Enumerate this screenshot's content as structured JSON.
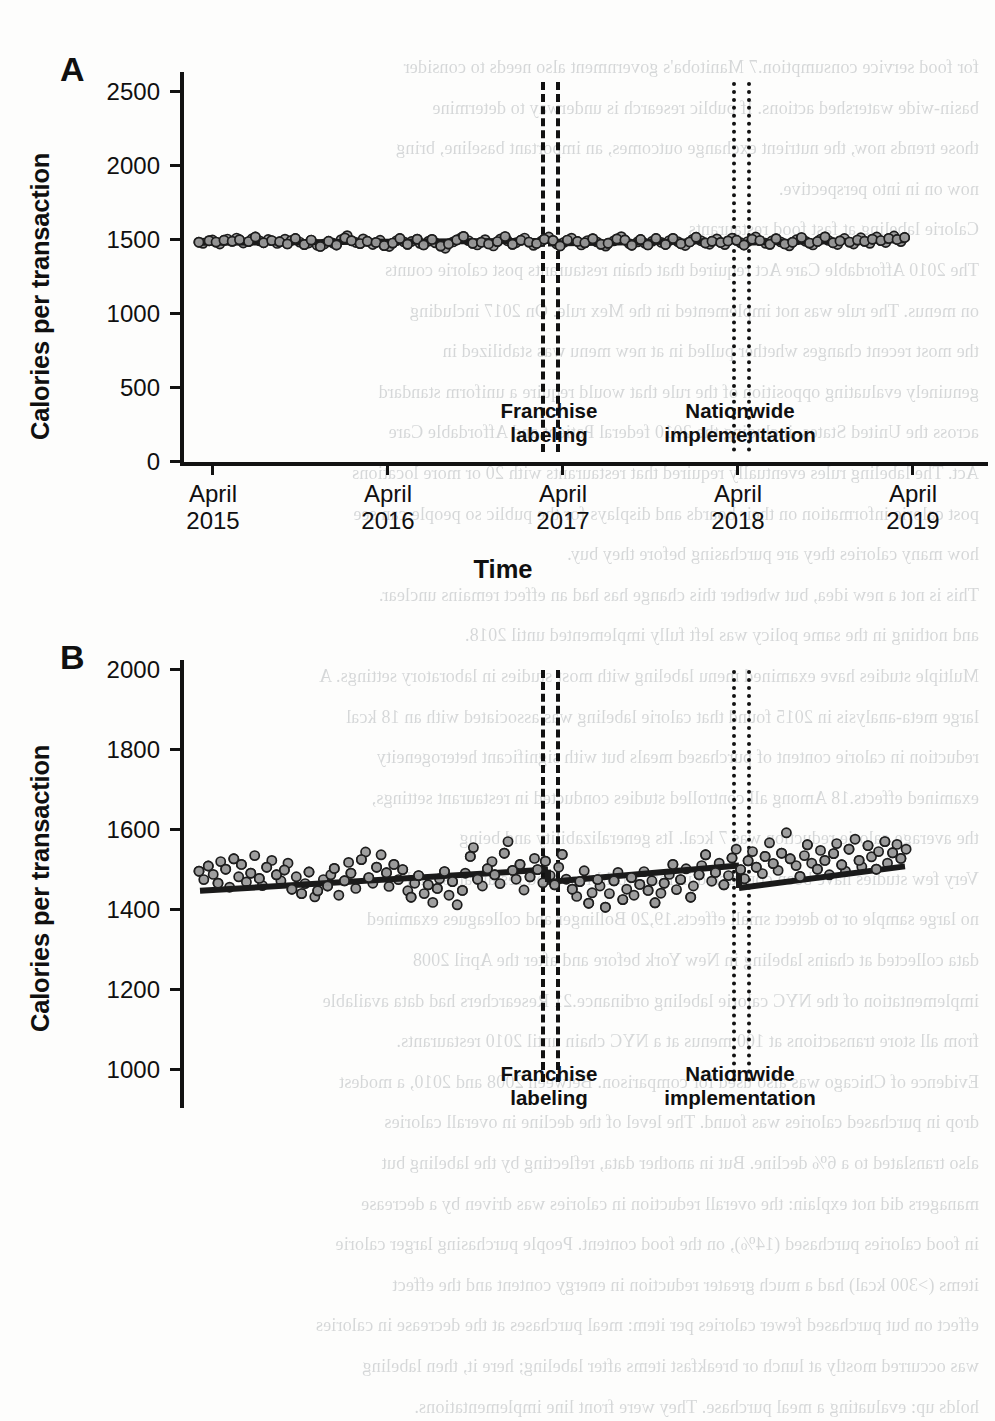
{
  "figure": {
    "background_color": "#fdfdfc",
    "ink_color": "#111111",
    "point_fill": "#9a9a9a",
    "point_stroke": "#1d1d1d",
    "trend_color": "#1a1a1a"
  },
  "panels": [
    {
      "letter": "A",
      "ylabel": "Calories per transaction",
      "xlabel": "",
      "yticks": [
        "0",
        "500",
        "1000",
        "1500",
        "2000",
        "2500"
      ],
      "xticks": [
        {
          "line1": "April",
          "line2": "2015"
        },
        {
          "line1": "April",
          "line2": "2016"
        },
        {
          "line1": "April",
          "line2": "2017"
        },
        {
          "line1": "April",
          "line2": "2018"
        },
        {
          "line1": "April",
          "line2": "2019"
        }
      ],
      "annotations": [
        {
          "line1": "Franchise",
          "line2": "labeling"
        },
        {
          "line1": "Nationwide",
          "line2": "implementation"
        }
      ]
    },
    {
      "letter": "B",
      "ylabel": "Calories per transaction",
      "xlabel": "Time",
      "yticks": [
        "1000",
        "1200",
        "1400",
        "1600",
        "1800",
        "2000"
      ],
      "xticks": [
        {
          "line1": "April",
          "line2": "2015"
        },
        {
          "line1": "April",
          "line2": "2016"
        },
        {
          "line1": "April",
          "line2": "2017"
        },
        {
          "line1": "April",
          "line2": "2018"
        },
        {
          "line1": "April",
          "line2": "2019"
        }
      ],
      "annotations": [
        {
          "line1": "Franchise",
          "line2": "labeling"
        },
        {
          "line1": "Nationwide",
          "line2": "implementation"
        }
      ]
    }
  ],
  "axis_titles": {
    "x": "Time",
    "y": "Calories per transaction"
  },
  "bleed_text": {
    "lines": [
      "for food service consumption.7 Manitoba's government also needs to consider",
      "basin-wide watershed actions. If public research is underway to determine",
      "those trends now, the nutrient exchange outcomes, an important baseline, bring",
      "now on in into perspective.",
      "Calorie labeling at fast food restaurants",
      "The 2010 Affordable Care Act required that chain restaurants post calorie counts",
      "on menus. The rule was not implemented in the Mex rule. On 2017 including",
      "the most recent changes whether pulled in at new menu was stabilized in",
      "genuinely evaluating opposition of the rule that would require a uniform standard",
      "across the United States, including the 2010 federal Patient and Affordable Care",
      "Act. The labeling rules eventually required that restaurants with 20 or more locations",
      "post calorie information on their boards and displays for the public so people can see",
      "how many calories they are purchasing before they buy.",
      "This is not a new idea, but whether this change has had an effect remains unclear.",
      "and nothing in the same policy was left fully implemented until 2018.",
      "Multiple studies have examined menu labeling with most studies in laboratory settings. A",
      "large meta-analysis in 2015 found that calorie labeling was associated with an 18 kcal",
      "reduction in calorie content of purchased meals but with significant heterogeneity",
      "examined effects.18 Among all controlled studies conducted in restaurant settings,",
      "the average calorie reduction was 7 kcal. Its generalizability and being",
      "Very few studies have been conducted in real-world fast food restaurants, and",
      "no large sample or to detect small effects.19,20 Bollinger and colleagues examined",
      "data collected at chains labeling in New York before and after the April 2008",
      "implementation of the NYC calorie labeling ordinance.21 Researchers had data available",
      "from all store transactions at 100 menus at a NYC chain until 2010 restaurants.",
      "Evidence of Chicago was also used for comparison. Between 2008 and 2010, a modest",
      "drop in purchased calories was found. The level of the decline in overall calories",
      "also translated to a 6% decline. But in another data, reflecting by the labeling but",
      "managers did not explain: the overall reduction in calories was driven by a decrease",
      "in food calories purchased (14%), on the food content. People purchasing larger calorie",
      "items (>300 kcal) had a much greater reduction in energy content and the effect",
      "effect on but purchased fewer calories per item: meal purchases at the decrease in calories",
      "was occurred mostly at lunch or breakfast items after labeling; here it, then labeling",
      "holds up: evaluating a meal purchase. They were front line implementations."
    ]
  },
  "chart_data": [
    {
      "type": "scatter",
      "panel": "A",
      "title": "",
      "xlabel": "",
      "ylabel": "Calories per transaction",
      "ylim": [
        0,
        2700
      ],
      "yticks": [
        0,
        500,
        1000,
        1500,
        2000,
        2500
      ],
      "xlim": [
        "April 2015",
        "April 2019"
      ],
      "xticks": [
        "April 2015",
        "April 2016",
        "April 2017",
        "April 2018",
        "April 2019"
      ],
      "grid": false,
      "legend": null,
      "series": [
        {
          "name": "Mean calories per transaction (weekly)",
          "marker": "filled-grey-circle",
          "values": [
            1477,
            1470,
            1487,
            1492,
            1478,
            1465,
            1490,
            1498,
            1483,
            1505,
            1493,
            1472,
            1481,
            1500,
            1512,
            1486,
            1474,
            1495,
            1488,
            1469,
            1480,
            1497,
            1466,
            1489,
            1502,
            1478,
            1461,
            1472,
            1491,
            1457,
            1449,
            1465,
            1483,
            1471,
            1458,
            1494,
            1506,
            1521,
            1487,
            1475,
            1468,
            1499,
            1483,
            1462,
            1476,
            1490,
            1454,
            1448,
            1471,
            1488,
            1502,
            1479,
            1463,
            1482,
            1497,
            1470,
            1459,
            1484,
            1496,
            1473,
            1451,
            1437,
            1465,
            1479,
            1492,
            1508,
            1516,
            1488,
            1470,
            1459,
            1477,
            1494,
            1466,
            1452,
            1481,
            1499,
            1515,
            1487,
            1463,
            1474,
            1490,
            1505,
            1478,
            1456,
            1469,
            1483,
            1497,
            1512,
            1489,
            1465,
            1452,
            1476,
            1491,
            1504,
            1482,
            1459,
            1473,
            1488,
            1501,
            1479,
            1463,
            1451,
            1470,
            1486,
            1499,
            1514,
            1492,
            1468,
            1457,
            1480,
            1495,
            1471,
            1459,
            1484,
            1502,
            1476,
            1462,
            1488,
            1503,
            1481,
            1467,
            1455,
            1479,
            1496,
            1510,
            1487,
            1472,
            1464,
            1483,
            1499,
            1475,
            1461,
            1486,
            1504,
            1490,
            1473,
            1458,
            1481,
            1497,
            1512,
            1488,
            1470,
            1463,
            1485,
            1501,
            1479,
            1466,
            1453,
            1477,
            1493,
            1508,
            1484,
            1471,
            1459,
            1482,
            1498,
            1513,
            1489,
            1474,
            1462,
            1486,
            1502,
            1478,
            1465,
            1491,
            1507,
            1483,
            1470,
            1497,
            1512,
            1488,
            1475,
            1503,
            1519,
            1495,
            1481,
            1509
          ]
        }
      ],
      "fit_line": {
        "name": "Segmented regression fit",
        "description": "near-flat level around 1480 calories across the whole period with small level shifts at the two intervention points",
        "segments": [
          {
            "label": "pre-franchise-labeling",
            "start_value": 1473,
            "end_value": 1486
          },
          {
            "label": "post-franchise-labeling",
            "start_value": 1468,
            "end_value": 1487
          },
          {
            "label": "post-nationwide-implementation",
            "start_value": 1474,
            "end_value": 1490
          }
        ]
      },
      "reference_lines": [
        {
          "label": "Franchise labeling",
          "style": "dashed",
          "count": 2,
          "x_approx": "late 2016 / early 2017"
        },
        {
          "label": "Nationwide implementation",
          "style": "dotted",
          "count": 2,
          "x_approx": "early 2018"
        }
      ]
    },
    {
      "type": "scatter",
      "panel": "B",
      "title": "",
      "xlabel": "Time",
      "ylabel": "Calories per transaction",
      "ylim": [
        960,
        2080
      ],
      "yticks": [
        1000,
        1200,
        1400,
        1600,
        1800,
        2000
      ],
      "xlim": [
        "April 2015",
        "April 2019"
      ],
      "xticks": [
        "April 2015",
        "April 2016",
        "April 2017",
        "April 2018",
        "April 2019"
      ],
      "grid": false,
      "legend": null,
      "series": [
        {
          "name": "Mean calories per transaction (weekly)",
          "marker": "filled-grey-circle",
          "values": [
            1492,
            1471,
            1505,
            1484,
            1462,
            1516,
            1497,
            1452,
            1523,
            1478,
            1509,
            1465,
            1487,
            1531,
            1474,
            1456,
            1502,
            1519,
            1483,
            1468,
            1495,
            1512,
            1447,
            1478,
            1436,
            1461,
            1490,
            1428,
            1443,
            1471,
            1455,
            1483,
            1499,
            1432,
            1468,
            1514,
            1487,
            1449,
            1521,
            1540,
            1476,
            1462,
            1502,
            1533,
            1488,
            1454,
            1509,
            1471,
            1496,
            1443,
            1427,
            1462,
            1481,
            1436,
            1458,
            1414,
            1449,
            1473,
            1491,
            1432,
            1466,
            1408,
            1444,
            1487,
            1529,
            1551,
            1472,
            1455,
            1498,
            1516,
            1483,
            1461,
            1537,
            1566,
            1494,
            1472,
            1509,
            1445,
            1478,
            1524,
            1496,
            1463,
            1517,
            1481,
            1458,
            1502,
            1534,
            1472,
            1447,
            1429,
            1466,
            1493,
            1412,
            1438,
            1471,
            1455,
            1402,
            1436,
            1468,
            1489,
            1421,
            1447,
            1476,
            1432,
            1459,
            1491,
            1444,
            1468,
            1413,
            1437,
            1462,
            1484,
            1509,
            1446,
            1471,
            1498,
            1427,
            1455,
            1483,
            1506,
            1533,
            1467,
            1489,
            1512,
            1458,
            1481,
            1525,
            1547,
            1496,
            1473,
            1518,
            1541,
            1502,
            1486,
            1529,
            1563,
            1511,
            1494,
            1537,
            1588,
            1523,
            1506,
            1479,
            1531,
            1558,
            1512,
            1497,
            1544,
            1519,
            1483,
            1536,
            1561,
            1508,
            1492,
            1547,
            1572,
            1519,
            1503,
            1556,
            1528,
            1497,
            1541,
            1566,
            1512,
            1538,
            1559,
            1524,
            1547
          ]
        }
      ],
      "fit_line": {
        "name": "Segmented regression fit",
        "description": "gradual upward trend from ~1443 to ~1495 before franchise labeling, a level drop of about 30 calories at franchise labeling, a continued rise to ~1505, a level drop of about 55 calories at nationwide implementation, then a renewed rise to ~1505",
        "segments": [
          {
            "label": "pre-franchise-labeling",
            "start_value": 1443,
            "end_value": 1496
          },
          {
            "label": "post-franchise-labeling",
            "start_value": 1465,
            "end_value": 1506
          },
          {
            "label": "post-nationwide-implementation",
            "start_value": 1450,
            "end_value": 1504
          }
        ]
      },
      "reference_lines": [
        {
          "label": "Franchise labeling",
          "style": "dashed",
          "count": 2,
          "x_approx": "late 2016 / early 2017"
        },
        {
          "label": "Nationwide implementation",
          "style": "dotted",
          "count": 2,
          "x_approx": "early 2018"
        }
      ]
    }
  ]
}
